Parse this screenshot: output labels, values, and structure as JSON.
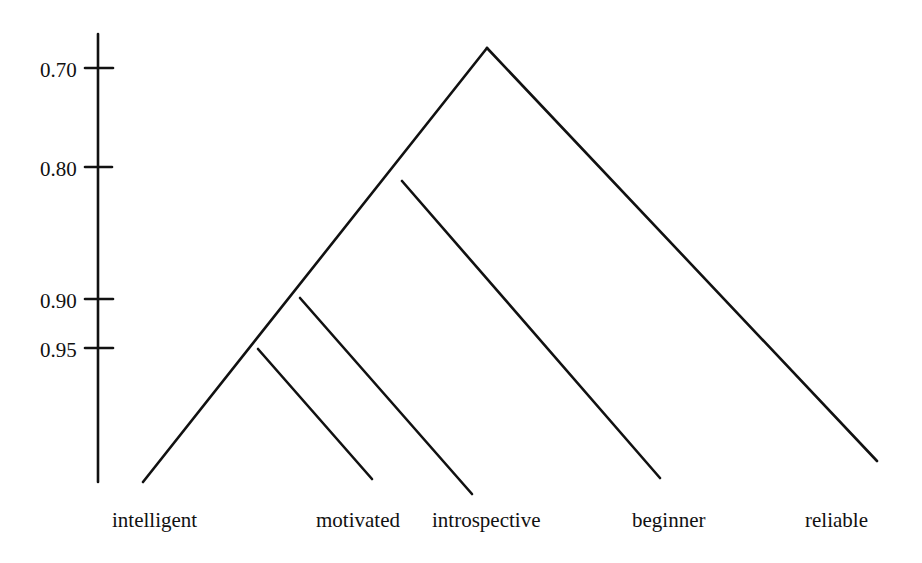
{
  "diagram": {
    "type": "dendrogram",
    "axis": {
      "ticks": [
        {
          "label": "0.70",
          "value": 0.7
        },
        {
          "label": "0.80",
          "value": 0.8
        },
        {
          "label": "0.90",
          "value": 0.9
        },
        {
          "label": "0.95",
          "value": 0.95
        }
      ]
    },
    "leaves": [
      {
        "label": "intelligent"
      },
      {
        "label": "motivated"
      },
      {
        "label": "introspective"
      },
      {
        "label": "beginner"
      },
      {
        "label": "reliable"
      }
    ],
    "merges": [
      {
        "items": [
          "intelligent",
          "motivated"
        ],
        "similarity": 0.95
      },
      {
        "items": [
          "intelligent+motivated",
          "introspective"
        ],
        "similarity": 0.9
      },
      {
        "items": [
          "intelligent+motivated+introspective",
          "beginner"
        ],
        "similarity": 0.81
      },
      {
        "items": [
          "all-but-reliable",
          "reliable"
        ],
        "similarity": 0.68
      }
    ],
    "line_color": "#111111"
  }
}
